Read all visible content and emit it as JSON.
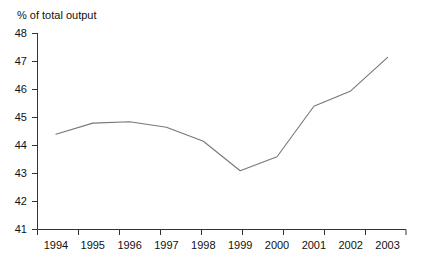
{
  "chart_data": {
    "type": "line",
    "title": "% of total output",
    "xlabel": "",
    "ylabel": "",
    "categories": [
      "1994",
      "1995",
      "1996",
      "1997",
      "1998",
      "1999",
      "2000",
      "2001",
      "2002",
      "2003"
    ],
    "values": [
      44.4,
      44.8,
      44.85,
      44.65,
      44.15,
      43.1,
      43.6,
      45.4,
      45.95,
      47.15
    ],
    "series": [
      {
        "name": "% of total output",
        "values": [
          44.4,
          44.8,
          44.85,
          44.65,
          44.15,
          43.1,
          43.6,
          45.4,
          45.95,
          47.15
        ]
      }
    ],
    "ylim": [
      41,
      48
    ],
    "yticks": [
      41,
      42,
      43,
      44,
      45,
      46,
      47,
      48
    ],
    "ytick_labels": [
      "41",
      "42",
      "43",
      "44",
      "45",
      "46",
      "47",
      "48"
    ],
    "xtick_labels": [
      "1994",
      "1995",
      "1996",
      "1997",
      "1998",
      "1999",
      "2000",
      "2001",
      "2002",
      "2003"
    ],
    "grid": false,
    "legend": false,
    "legend_position": "none",
    "line_color": "#666666",
    "axis_color": "#333333",
    "background_color": "#ffffff"
  }
}
